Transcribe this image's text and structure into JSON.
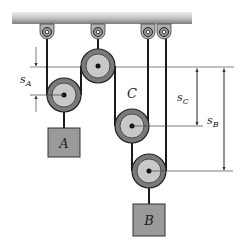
{
  "diagram": {
    "type": "pulley-system",
    "labels": {
      "pulley_c": "C",
      "block_a": "A",
      "block_b": "B",
      "s_a_main": "s",
      "s_a_sub": "A",
      "s_c_main": "s",
      "s_c_sub": "C",
      "s_b_main": "s",
      "s_b_sub": "B"
    },
    "colors": {
      "ceiling_light": "#e6e6e6",
      "ceiling_dark": "#8c8c8c",
      "pulley_outer": "#7a7a7a",
      "pulley_inner": "#c8c8c8",
      "block_fill": "#9a9a9a",
      "rope": "#1a1a1a",
      "dimension_line": "#555555"
    }
  }
}
